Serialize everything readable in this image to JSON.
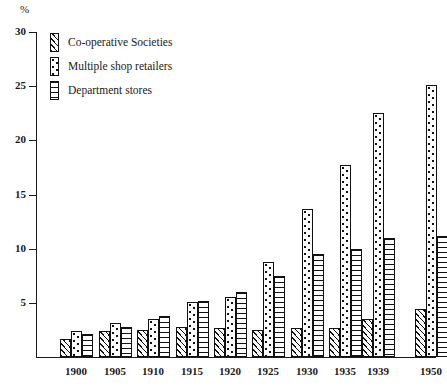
{
  "chart_data": {
    "type": "bar",
    "title": "",
    "subtitle": "",
    "xlabel": "",
    "ylabel": "%",
    "unit_label": "%",
    "ylim": [
      0,
      30
    ],
    "yticks": [
      0,
      5,
      10,
      15,
      20,
      25,
      30
    ],
    "ytick_labels": [
      "",
      "5",
      "10",
      "15",
      "20",
      "25",
      "30"
    ],
    "grid": false,
    "legend_position": "top-left",
    "categories": [
      "1900",
      "1905",
      "1910",
      "1915",
      "1920",
      "1925",
      "1930",
      "1935",
      "1939",
      "1950"
    ],
    "series": [
      {
        "name": "Co-operative Societies",
        "pattern": "diagonal-hatch",
        "values": [
          1.7,
          2.4,
          2.5,
          2.8,
          2.7,
          2.5,
          2.7,
          2.7,
          3.5,
          4.4
        ]
      },
      {
        "name": "Multiple shop retailers",
        "pattern": "dotted",
        "values": [
          2.4,
          3.1,
          3.5,
          5.1,
          5.5,
          8.8,
          13.7,
          17.7,
          22.5,
          25.1
        ]
      },
      {
        "name": "Department stores",
        "pattern": "horizontal-lines",
        "values": [
          2.1,
          2.8,
          3.8,
          5.2,
          6.0,
          7.5,
          9.5,
          10.0,
          11.0,
          11.2
        ]
      }
    ],
    "colors": {
      "ink": "#111111",
      "background": "#ffffff"
    }
  },
  "legend": {
    "items": [
      {
        "label": "Co-operative Societies",
        "pattern": "diagonal-hatch"
      },
      {
        "label": "Multiple shop retailers",
        "pattern": "dotted"
      },
      {
        "label": "Department stores",
        "pattern": "horizontal-lines"
      }
    ]
  }
}
